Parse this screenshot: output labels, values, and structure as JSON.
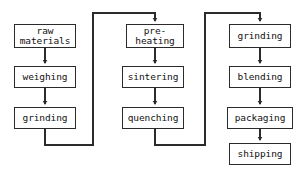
{
  "diagram": {
    "type": "flowchart",
    "orientation": "three-column serpentine",
    "background_color": "#ffffff",
    "stroke_color": "#2b2b2b",
    "text_color": "#111111",
    "columns": [
      {
        "name": "column-1",
        "nodes": [
          {
            "id": "raw-materials",
            "label": "raw\nmaterials",
            "x": 14,
            "y": 24,
            "w": 62,
            "h": 24
          },
          {
            "id": "weighing",
            "label": "weighing",
            "x": 14,
            "y": 66,
            "w": 62,
            "h": 22
          },
          {
            "id": "grinding-1",
            "label": "grinding",
            "x": 14,
            "y": 107,
            "w": 62,
            "h": 22
          }
        ]
      },
      {
        "name": "column-2",
        "nodes": [
          {
            "id": "pre-heating",
            "label": "pre-\nheating",
            "x": 126,
            "y": 24,
            "w": 58,
            "h": 24
          },
          {
            "id": "sintering",
            "label": "sintering",
            "x": 122,
            "y": 66,
            "w": 62,
            "h": 22
          },
          {
            "id": "quenching",
            "label": "quenching",
            "x": 122,
            "y": 107,
            "w": 62,
            "h": 22
          }
        ]
      },
      {
        "name": "column-3",
        "nodes": [
          {
            "id": "grinding-2",
            "label": "grinding",
            "x": 229,
            "y": 24,
            "w": 62,
            "h": 24
          },
          {
            "id": "blending",
            "label": "blending",
            "x": 229,
            "y": 66,
            "w": 62,
            "h": 22
          },
          {
            "id": "packaging",
            "label": "packaging",
            "x": 227,
            "y": 107,
            "w": 66,
            "h": 22
          },
          {
            "id": "shipping",
            "label": "shipping",
            "x": 229,
            "y": 143,
            "w": 62,
            "h": 22
          }
        ]
      }
    ],
    "edges": [
      {
        "id": "edge-raw-materials-to-weighing",
        "from": "raw-materials",
        "to": "weighing",
        "kind": "straight-down",
        "arrow": true
      },
      {
        "id": "edge-weighing-to-grinding-1",
        "from": "weighing",
        "to": "grinding-1",
        "kind": "straight-down",
        "arrow": true
      },
      {
        "id": "edge-grinding-1-to-pre-heating",
        "from": "grinding-1",
        "to": "pre-heating",
        "kind": "serpentine-right",
        "arrow": true
      },
      {
        "id": "edge-pre-heating-to-sintering",
        "from": "pre-heating",
        "to": "sintering",
        "kind": "straight-down",
        "arrow": true
      },
      {
        "id": "edge-sintering-to-quenching",
        "from": "sintering",
        "to": "quenching",
        "kind": "straight-down",
        "arrow": true
      },
      {
        "id": "edge-quenching-to-grinding-2",
        "from": "quenching",
        "to": "grinding-2",
        "kind": "serpentine-right",
        "arrow": true
      },
      {
        "id": "edge-grinding-2-to-blending",
        "from": "grinding-2",
        "to": "blending",
        "kind": "straight-down",
        "arrow": true
      },
      {
        "id": "edge-blending-to-packaging",
        "from": "blending",
        "to": "packaging",
        "kind": "straight-down",
        "arrow": true
      },
      {
        "id": "edge-packaging-to-shipping",
        "from": "packaging",
        "to": "shipping",
        "kind": "straight-down",
        "arrow": true
      }
    ]
  }
}
